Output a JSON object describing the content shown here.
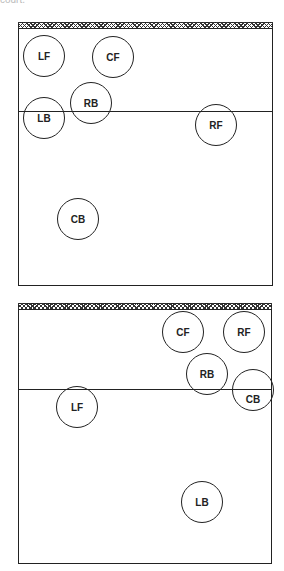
{
  "caption": "court.",
  "diagrams": [
    {
      "name": "court-1",
      "players": [
        {
          "label": "LF",
          "x": 44,
          "y": 56
        },
        {
          "label": "CF",
          "x": 113,
          "y": 57
        },
        {
          "label": "RB",
          "x": 91,
          "y": 103
        },
        {
          "label": "LB",
          "x": 44,
          "y": 118
        },
        {
          "label": "RF",
          "x": 216,
          "y": 125
        },
        {
          "label": "CB",
          "x": 78,
          "y": 219
        }
      ]
    },
    {
      "name": "court-2",
      "players": [
        {
          "label": "CF",
          "x": 183,
          "y": 332
        },
        {
          "label": "RF",
          "x": 244,
          "y": 332
        },
        {
          "label": "RB",
          "x": 207,
          "y": 374
        },
        {
          "label": "CB",
          "x": 253,
          "y": 390
        },
        {
          "label": "LF",
          "x": 77,
          "y": 407
        },
        {
          "label": "LB",
          "x": 202,
          "y": 502
        }
      ]
    }
  ]
}
